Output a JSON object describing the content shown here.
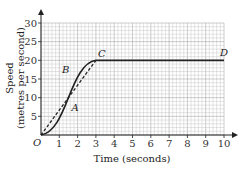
{
  "chart_data": {
    "type": "line",
    "title": "",
    "xlabel": "Time (seconds)",
    "ylabel_line1": "Speed",
    "ylabel_line2": "(metres per second)",
    "xlim": [
      0,
      10
    ],
    "ylim": [
      0,
      30
    ],
    "x_ticks": [
      "1",
      "2",
      "3",
      "4",
      "5",
      "6",
      "7",
      "8",
      "9",
      "10"
    ],
    "y_ticks": [
      "5",
      "10",
      "15",
      "20",
      "25",
      "30"
    ],
    "origin_label": "O",
    "grid": true,
    "series": [
      {
        "name": "speed curve",
        "style": "solid",
        "x": [
          0,
          0.5,
          1,
          1.5,
          2,
          2.5,
          3,
          10
        ],
        "y": [
          0,
          1.5,
          4.5,
          10,
          16,
          19,
          20,
          20
        ]
      },
      {
        "name": "chord OC",
        "style": "dashed",
        "x": [
          0,
          3
        ],
        "y": [
          0,
          20
        ]
      }
    ],
    "annotations": [
      {
        "label": "A",
        "x": 1.5,
        "y": 7
      },
      {
        "label": "B",
        "x": 1.8,
        "y": 16
      },
      {
        "label": "C",
        "x": 3,
        "y": 20
      },
      {
        "label": "D",
        "x": 10,
        "y": 20
      }
    ]
  }
}
